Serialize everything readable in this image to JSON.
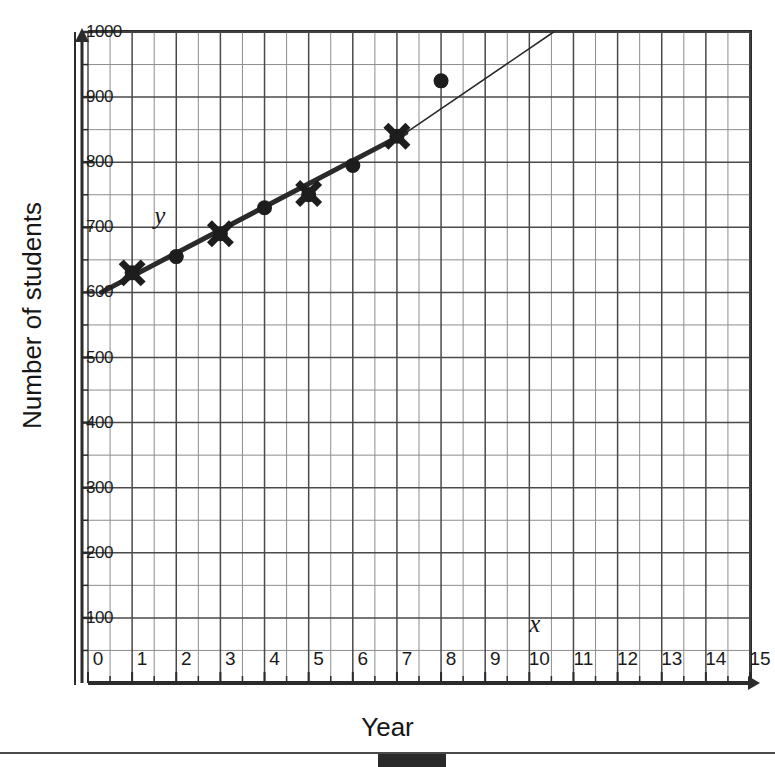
{
  "chart_data": {
    "type": "scatter",
    "title": "",
    "xlabel": "Year",
    "ylabel": "Number of students",
    "xlim": [
      0,
      15
    ],
    "ylim": [
      0,
      1000
    ],
    "xticks": [
      0,
      1,
      2,
      3,
      4,
      5,
      6,
      7,
      8,
      9,
      10,
      11,
      12,
      13,
      14,
      15
    ],
    "xtick_labels": [
      "0",
      "1",
      "2",
      "3",
      "4",
      "5",
      "6",
      "7",
      "8",
      "9",
      "10",
      "11",
      "12",
      "13",
      "14",
      "15"
    ],
    "yticks": [
      100,
      200,
      300,
      400,
      500,
      600,
      700,
      800,
      900,
      1000
    ],
    "ytick_labels": [
      "100",
      "200",
      "300",
      "400",
      "500",
      "600",
      "700",
      "800",
      "900",
      "1000"
    ],
    "y_minor_step": 50,
    "x_minor_step": 0.5,
    "grid": true,
    "legend": "none",
    "axis_variable_labels": {
      "y": "y",
      "x": "x"
    },
    "series": [
      {
        "name": "Observed data",
        "marker": "filled-circle",
        "points": [
          {
            "x": 1,
            "y": 630
          },
          {
            "x": 2,
            "y": 655
          },
          {
            "x": 3,
            "y": 690
          },
          {
            "x": 4,
            "y": 730
          },
          {
            "x": 5,
            "y": 750
          },
          {
            "x": 6,
            "y": 795
          },
          {
            "x": 7,
            "y": 840
          },
          {
            "x": 8,
            "y": 925
          }
        ]
      },
      {
        "name": "Model values",
        "marker": "cross",
        "points": [
          {
            "x": 1,
            "y": 630
          },
          {
            "x": 3,
            "y": 690
          },
          {
            "x": 5,
            "y": 752
          },
          {
            "x": 7,
            "y": 840
          }
        ]
      },
      {
        "name": "Line of best fit",
        "marker": "line",
        "segments": [
          {
            "x1": 0.3,
            "y1": 600,
            "x2": 7.2,
            "y2": 845,
            "weight": "thick"
          },
          {
            "x1": 7.2,
            "y1": 845,
            "x2": 10.55,
            "y2": 1000,
            "weight": "thin"
          }
        ]
      }
    ],
    "annotations": [
      {
        "text": "y",
        "x": 1.5,
        "y": 715,
        "style": "italic"
      },
      {
        "text": "x",
        "x": 10.0,
        "y": 88,
        "style": "italic"
      }
    ]
  },
  "colors": {
    "axis": "#2b2b2b",
    "grid_major": "#4a4a4a",
    "grid_minor": "#8d8d8d",
    "marker": "#1d1d1d",
    "line": "#2a2a2a",
    "background": "#ffffff"
  },
  "footer": {
    "rule": "",
    "block": ""
  }
}
